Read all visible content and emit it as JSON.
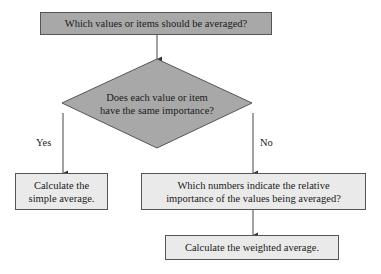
{
  "nodes": {
    "start": "Which values or items should be averaged?",
    "decision": [
      "Does each value or item",
      "have the same importance?"
    ],
    "simple": [
      "Calculate the",
      "simple average."
    ],
    "relative": [
      "Which numbers indicate the relative",
      "importance of the values being averaged?"
    ],
    "weighted": "Calculate the weighted average."
  },
  "edges": {
    "yes": "Yes",
    "no": "No"
  },
  "colors": {
    "dark_fill": "#a8a8a8",
    "light_fill": "#eaeaea",
    "stroke": "#555555"
  }
}
